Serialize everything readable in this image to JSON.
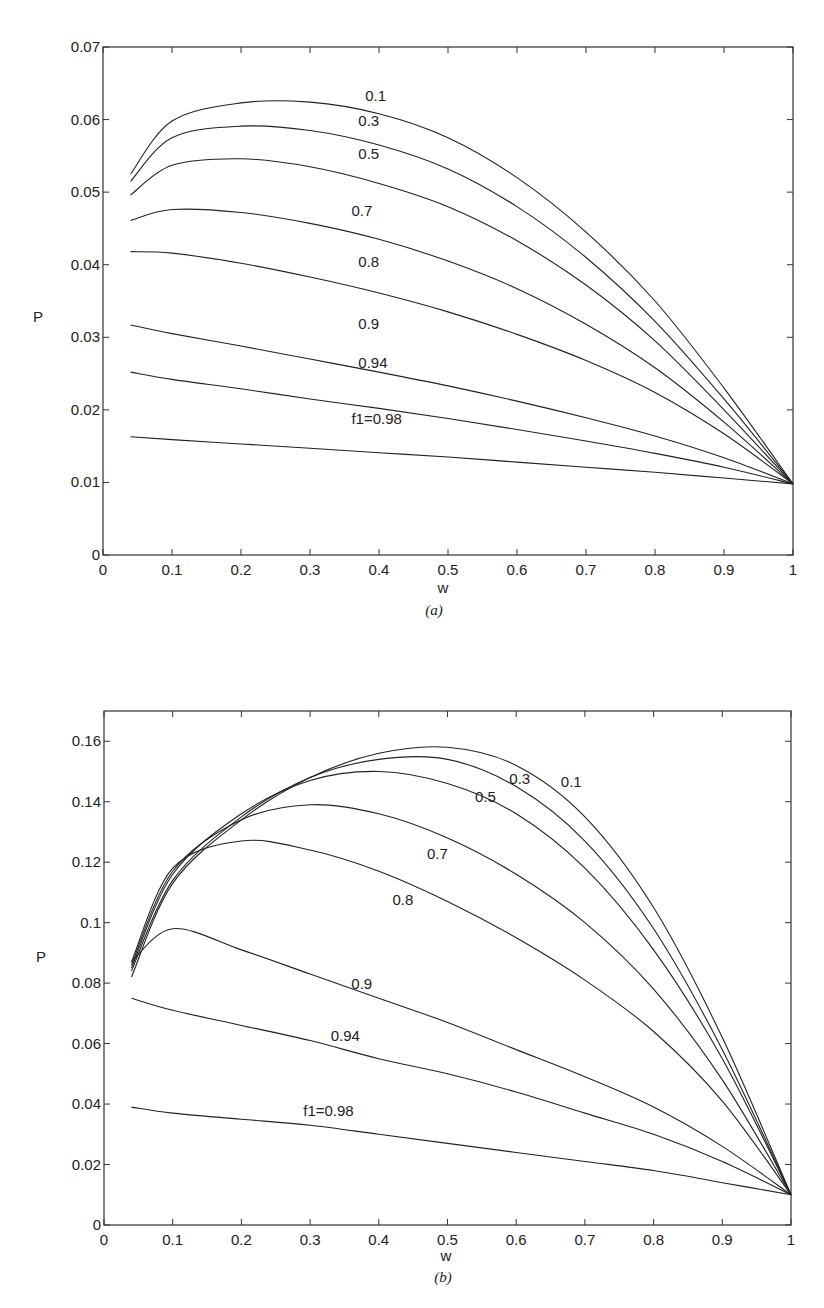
{
  "chart_data": [
    {
      "id": "a",
      "type": "line",
      "caption": "(a)",
      "xlabel": "w",
      "ylabel": "P",
      "xlim": [
        0,
        1
      ],
      "ylim": [
        0,
        0.07
      ],
      "xticks": [
        "0",
        "0.1",
        "0.2",
        "0.3",
        "0.4",
        "0.5",
        "0.6",
        "0.7",
        "0.8",
        "0.9",
        "1"
      ],
      "yticks": [
        "0",
        "0.01",
        "0.02",
        "0.03",
        "0.04",
        "0.05",
        "0.06",
        "0.07"
      ],
      "grid": false,
      "legend": "inline curve labels",
      "x": [
        0.04,
        0.1,
        0.2,
        0.3,
        0.4,
        0.5,
        0.6,
        0.7,
        0.8,
        0.9,
        1.0
      ],
      "series": [
        {
          "name": "0.1",
          "label": "0.1",
          "values": [
            0.0525,
            0.0598,
            0.0623,
            0.0624,
            0.0608,
            0.0575,
            0.052,
            0.0445,
            0.035,
            0.023,
            0.0098
          ]
        },
        {
          "name": "0.3",
          "label": "0.3",
          "values": [
            0.0515,
            0.0575,
            0.0591,
            0.0585,
            0.0565,
            0.0532,
            0.048,
            0.041,
            0.0322,
            0.0215,
            0.0098
          ]
        },
        {
          "name": "0.5",
          "label": "0.5",
          "values": [
            0.0496,
            0.0537,
            0.0546,
            0.0535,
            0.0512,
            0.048,
            0.0433,
            0.0372,
            0.0295,
            0.02,
            0.0098
          ]
        },
        {
          "name": "0.7",
          "label": "0.7",
          "values": [
            0.0461,
            0.0476,
            0.0472,
            0.0457,
            0.0435,
            0.0405,
            0.0367,
            0.0318,
            0.0258,
            0.0183,
            0.0098
          ]
        },
        {
          "name": "0.8",
          "label": "0.8",
          "values": [
            0.0418,
            0.0416,
            0.0402,
            0.0383,
            0.0361,
            0.0335,
            0.0304,
            0.0268,
            0.0224,
            0.0167,
            0.0098
          ]
        },
        {
          "name": "0.9",
          "label": "0.9",
          "values": [
            0.0317,
            0.0305,
            0.0288,
            0.027,
            0.0252,
            0.0233,
            0.0212,
            0.0189,
            0.0164,
            0.0134,
            0.0098
          ]
        },
        {
          "name": "0.94",
          "label": "0.94",
          "values": [
            0.0252,
            0.0242,
            0.0229,
            0.0215,
            0.0202,
            0.0188,
            0.0173,
            0.0157,
            0.014,
            0.0121,
            0.0098
          ]
        },
        {
          "name": "f1=0.98",
          "label": "f1=0.98",
          "values": [
            0.0163,
            0.0159,
            0.0153,
            0.0147,
            0.0141,
            0.0135,
            0.0128,
            0.0121,
            0.0114,
            0.0106,
            0.0098
          ]
        }
      ]
    },
    {
      "id": "b",
      "type": "line",
      "caption": "(b)",
      "xlabel": "w",
      "ylabel": "P",
      "xlim": [
        0,
        1
      ],
      "ylim": [
        0,
        0.17
      ],
      "xticks": [
        "0",
        "0.1",
        "0.2",
        "0.3",
        "0.4",
        "0.5",
        "0.6",
        "0.7",
        "0.8",
        "0.9",
        "1"
      ],
      "yticks": [
        "0",
        "0.02",
        "0.04",
        "0.06",
        "0.08",
        "0.1",
        "0.12",
        "0.14",
        "0.16"
      ],
      "grid": false,
      "legend": "inline curve labels",
      "x": [
        0.04,
        0.1,
        0.2,
        0.3,
        0.4,
        0.5,
        0.6,
        0.7,
        0.8,
        0.9,
        1.0
      ],
      "series": [
        {
          "name": "0.1",
          "label": "0.1",
          "values": [
            0.082,
            0.113,
            0.134,
            0.148,
            0.156,
            0.158,
            0.152,
            0.135,
            0.105,
            0.062,
            0.01
          ]
        },
        {
          "name": "0.3",
          "label": "0.3",
          "values": [
            0.084,
            0.114,
            0.135,
            0.148,
            0.154,
            0.154,
            0.145,
            0.127,
            0.098,
            0.058,
            0.01
          ]
        },
        {
          "name": "0.5",
          "label": "0.5",
          "values": [
            0.085,
            0.116,
            0.136,
            0.147,
            0.15,
            0.146,
            0.136,
            0.118,
            0.091,
            0.055,
            0.01
          ]
        },
        {
          "name": "0.7",
          "label": "0.7",
          "values": [
            0.086,
            0.117,
            0.134,
            0.139,
            0.136,
            0.128,
            0.116,
            0.1,
            0.078,
            0.048,
            0.01
          ]
        },
        {
          "name": "0.8",
          "label": "0.8",
          "values": [
            0.087,
            0.118,
            0.127,
            0.124,
            0.117,
            0.107,
            0.095,
            0.081,
            0.064,
            0.041,
            0.01
          ]
        },
        {
          "name": "0.9",
          "label": "0.9",
          "values": [
            0.087,
            0.098,
            0.091,
            0.083,
            0.075,
            0.067,
            0.058,
            0.049,
            0.039,
            0.026,
            0.01
          ]
        },
        {
          "name": "0.94",
          "label": "0.94",
          "values": [
            0.075,
            0.071,
            0.066,
            0.061,
            0.055,
            0.05,
            0.044,
            0.037,
            0.03,
            0.021,
            0.01
          ]
        },
        {
          "name": "f1=0.98",
          "label": "f1=0.98",
          "values": [
            0.039,
            0.037,
            0.035,
            0.033,
            0.03,
            0.027,
            0.024,
            0.021,
            0.018,
            0.014,
            0.01
          ]
        }
      ]
    }
  ],
  "charts": {
    "a": {
      "caption": "(a)",
      "xlabel": "w",
      "ylabel": "P"
    },
    "b": {
      "caption": "(b)",
      "xlabel": "w",
      "ylabel": "P"
    }
  }
}
